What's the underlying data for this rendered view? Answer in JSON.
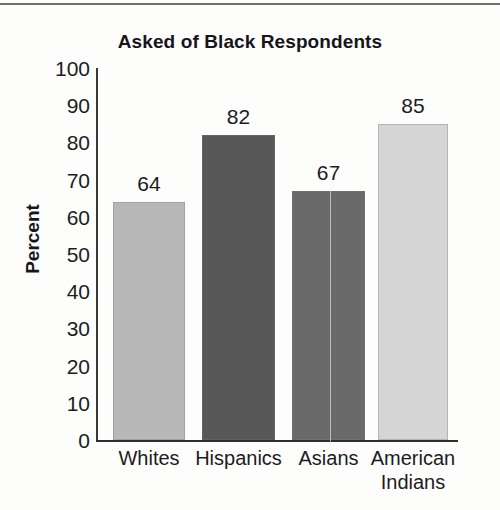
{
  "chart_data": {
    "type": "bar",
    "title": "Asked of Black Respondents",
    "xlabel": "",
    "ylabel": "Percent",
    "categories": [
      "Whites",
      "Hispanics",
      "Asians",
      "American Indians"
    ],
    "category_lines": [
      [
        "Whites"
      ],
      [
        "Hispanics"
      ],
      [
        "Asians"
      ],
      [
        "American",
        "Indians"
      ]
    ],
    "values": [
      64,
      82,
      67,
      85
    ],
    "value_labels": [
      "64",
      "82",
      "67",
      "85"
    ],
    "ylim": [
      0,
      100
    ],
    "ytick_step": 10,
    "yticks": [
      100,
      90,
      80,
      70,
      60,
      50,
      40,
      30,
      20,
      10,
      0
    ],
    "ytick_labels": [
      "100",
      "90",
      "80",
      "70",
      "60",
      "50",
      "40",
      "30",
      "20",
      "10",
      "0"
    ],
    "grid": false,
    "legend": false,
    "legend_position": "none",
    "bar_colors": [
      "#b8b8b8",
      "#585858",
      "#6a6a6a",
      "#d5d5d5"
    ],
    "bars": [
      {
        "category": "Whites",
        "value": 64,
        "label": "64",
        "color": "#b8b8b8"
      },
      {
        "category": "Hispanics",
        "value": 82,
        "label": "82",
        "color": "#585858"
      },
      {
        "category": "Asians",
        "value": 67,
        "label": "67",
        "color": "#6a6a6a"
      },
      {
        "category": "American Indians",
        "value": 85,
        "label": "85",
        "color": "#d5d5d5"
      }
    ]
  },
  "style": {
    "background": "#fdfdfc",
    "axis_color": "#2e2e31",
    "text_color": "#1c1c1f",
    "title_color": "#16161a"
  }
}
